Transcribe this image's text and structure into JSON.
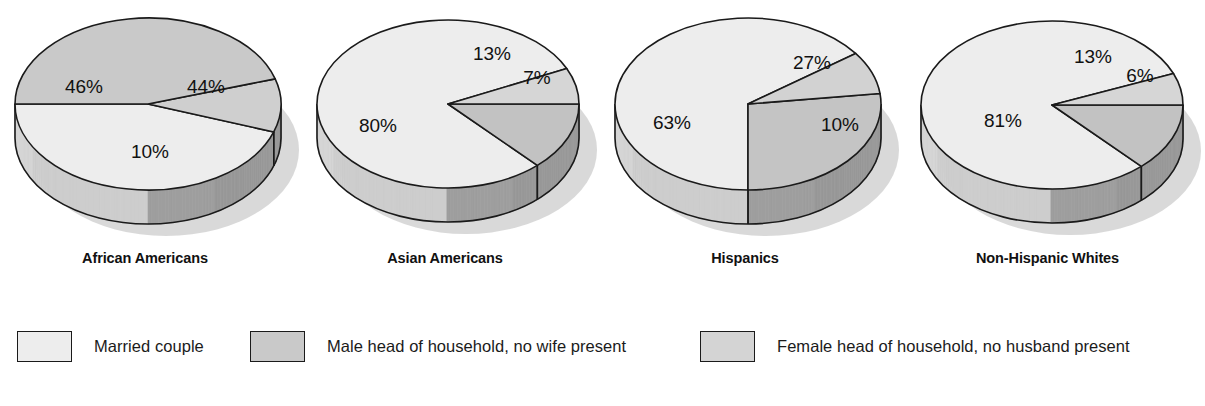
{
  "chart_data": {
    "type": "pie",
    "title": "",
    "legend_position": "bottom",
    "series_names": [
      "Married couple",
      "Male head of household, no wife present",
      "Female head of household, no husband present"
    ],
    "charts": [
      {
        "title": "African Americans",
        "labels": [
          "Married couple",
          "Female head of household, no husband present",
          "Male head of household, no wife present"
        ],
        "values": [
          44,
          10,
          46
        ],
        "display": [
          "44%",
          "10%",
          "46%"
        ]
      },
      {
        "title": "Asian Americans",
        "labels": [
          "Male head of household, no wife present",
          "Female head of household, no husband present",
          "Married couple"
        ],
        "values": [
          13,
          7,
          80
        ],
        "display": [
          "13%",
          "7%",
          "80%"
        ]
      },
      {
        "title": "Hispanics",
        "labels": [
          "Male head of household, no wife present",
          "Female head of household, no husband present",
          "Married couple"
        ],
        "values": [
          27,
          10,
          63
        ],
        "display": [
          "27%",
          "10%",
          "63%"
        ]
      },
      {
        "title": "Non-Hispanic Whites",
        "labels": [
          "Male head of household, no wife present",
          "Female head of household, no husband present",
          "Married couple"
        ],
        "values": [
          13,
          6,
          81
        ],
        "display": [
          "13%",
          "6%",
          "81%"
        ]
      }
    ]
  },
  "pies": [
    {
      "title": "African Americans",
      "title_left": 20,
      "title_width": 250,
      "cx": 148,
      "cy": 104,
      "rx": 133,
      "ry": 86,
      "depth": 34,
      "slices": [
        {
          "name": "married-couple",
          "start": 180,
          "end": 341,
          "fill": "#ededed",
          "label": "46%",
          "lx": 84,
          "ly": 88
        },
        {
          "name": "male-head",
          "start": 341,
          "end": 377,
          "fill": "#cfcfcf",
          "label": "10%",
          "lx": 150,
          "ly": 153
        },
        {
          "name": "female-head",
          "start": 17,
          "end": 180,
          "fill": "#c9c9c9",
          "label": "44%",
          "lx": 206,
          "ly": 88
        }
      ]
    },
    {
      "title": "Asian Americans",
      "title_left": 320,
      "title_width": 250,
      "cx": 448,
      "cy": 104,
      "rx": 131,
      "ry": 84,
      "depth": 34,
      "slices": [
        {
          "name": "married-couple",
          "start": 25,
          "end": 313,
          "fill": "#ededed",
          "label": "80%",
          "lx": 378,
          "ly": 127
        },
        {
          "name": "male-head",
          "start": 313,
          "end": 360,
          "fill": "#c2c2c2",
          "label": "13%",
          "lx": 492,
          "ly": 55
        },
        {
          "name": "female-head",
          "start": 0,
          "end": 25,
          "fill": "#d6d6d6",
          "label": "7%",
          "lx": 537,
          "ly": 79
        }
      ]
    },
    {
      "title": "Hispanics",
      "title_left": 620,
      "title_width": 250,
      "cx": 748,
      "cy": 104,
      "rx": 133,
      "ry": 86,
      "depth": 34,
      "slices": [
        {
          "name": "married-couple",
          "start": 36,
          "end": 270,
          "fill": "#ededed",
          "label": "63%",
          "lx": 672,
          "ly": 124
        },
        {
          "name": "male-head",
          "start": 270,
          "end": 367,
          "fill": "#c4c4c4",
          "label": "27%",
          "lx": 812,
          "ly": 64
        },
        {
          "name": "female-head",
          "start": 367,
          "end": 36,
          "fill": "#d2d2d2",
          "label": "10%",
          "lx": 840,
          "ly": 126
        }
      ]
    },
    {
      "title": "Non-Hispanic Whites",
      "title_left": 915,
      "title_width": 265,
      "cx": 1052,
      "cy": 105,
      "rx": 131,
      "ry": 84,
      "depth": 34,
      "slices": [
        {
          "name": "married-couple",
          "start": 22,
          "end": 313,
          "fill": "#ededed",
          "label": "81%",
          "lx": 1003,
          "ly": 122
        },
        {
          "name": "male-head",
          "start": 313,
          "end": 360,
          "fill": "#c2c2c2",
          "label": "13%",
          "lx": 1093,
          "ly": 58
        },
        {
          "name": "female-head",
          "start": 0,
          "end": 22,
          "fill": "#d6d6d6",
          "label": "6%",
          "lx": 1140,
          "ly": 77
        }
      ]
    }
  ],
  "legend": {
    "items": [
      {
        "label": "Married couple",
        "left": 17,
        "swatch_color": "#ededed"
      },
      {
        "label": "Male head of household, no wife present",
        "left": 250,
        "swatch_color": "#c9c9c9"
      },
      {
        "label": "Female head of household, no husband present",
        "left": 700,
        "swatch_color": "#d4d4d4"
      }
    ]
  },
  "colors": {
    "stroke": "#1a1a1a",
    "shadow": "#cccccc",
    "side_light": "#dcdcdc",
    "side_dark": "#9b9b9b",
    "background": "#ffffff"
  }
}
